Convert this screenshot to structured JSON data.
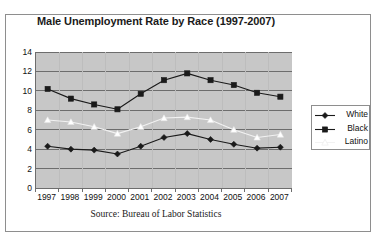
{
  "chart_data": {
    "type": "line",
    "title": "Male Unemployment Rate by Race (1997-2007)",
    "xlabel": "",
    "ylabel": "",
    "categories": [
      "1997",
      "1998",
      "1999",
      "2000",
      "2001",
      "2002",
      "2003",
      "2004",
      "2005",
      "2006",
      "2007"
    ],
    "ylim": [
      0,
      14
    ],
    "yticks": [
      "0",
      "2",
      "4",
      "6",
      "8",
      "10",
      "12",
      "14"
    ],
    "grid": true,
    "legend_position": "right",
    "series": [
      {
        "name": "White",
        "marker": "diamond",
        "color": "#1a1a1a",
        "line_color": "#1a1a1a",
        "values": [
          4.3,
          4.0,
          3.9,
          3.5,
          4.3,
          5.2,
          5.6,
          5.0,
          4.5,
          4.1,
          4.2
        ]
      },
      {
        "name": "Black",
        "marker": "square",
        "color": "#1a1a1a",
        "line_color": "#1a1a1a",
        "values": [
          10.2,
          9.2,
          8.6,
          8.1,
          9.7,
          11.1,
          11.8,
          11.1,
          10.6,
          9.8,
          9.4
        ]
      },
      {
        "name": "Latino",
        "marker": "triangle",
        "color": "#ffffff",
        "line_color": "#f2f2f2",
        "values": [
          7.0,
          6.8,
          6.3,
          5.6,
          6.3,
          7.2,
          7.3,
          7.0,
          6.0,
          5.2,
          5.5
        ]
      }
    ],
    "source_note": "Source:  Bureau of Labor Statistics",
    "plot_background": "#c7c7c7",
    "gridline_color": "#6d6d6d",
    "axis_color": "#6d6d6d",
    "frame_color": "#8e8e8e",
    "page_background": "#ffffff"
  }
}
